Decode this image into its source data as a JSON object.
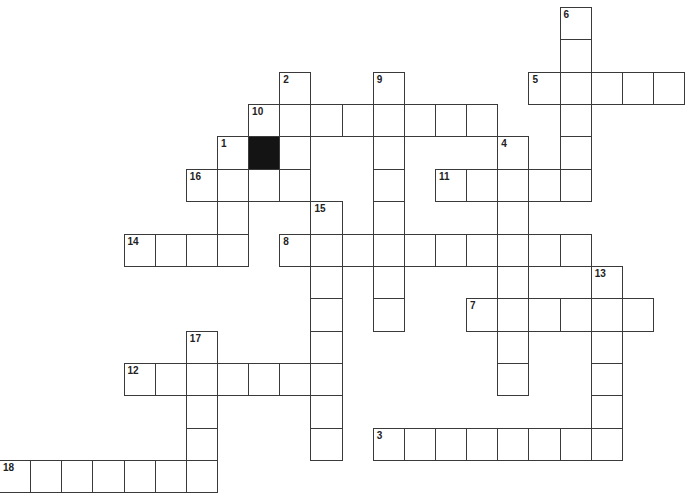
{
  "puzzle": {
    "grid": {
      "origin_x": -1,
      "origin_y": 7,
      "cell_width": 31.14,
      "cell_height": 32.36,
      "line_color": "#3a3a3a",
      "block_color": "#141414"
    },
    "entries": [
      {
        "number": "1",
        "direction": "down",
        "row": 4,
        "col": 7,
        "length": 4
      },
      {
        "number": "2",
        "direction": "down",
        "row": 2,
        "col": 9,
        "length": 4
      },
      {
        "number": "3",
        "direction": "across",
        "row": 13,
        "col": 12,
        "length": 8
      },
      {
        "number": "4",
        "direction": "down",
        "row": 4,
        "col": 16,
        "length": 8
      },
      {
        "number": "5",
        "direction": "across",
        "row": 2,
        "col": 17,
        "length": 5
      },
      {
        "number": "6",
        "direction": "down",
        "row": 0,
        "col": 18,
        "length": 6
      },
      {
        "number": "7",
        "direction": "across",
        "row": 9,
        "col": 15,
        "length": 6
      },
      {
        "number": "8",
        "direction": "across",
        "row": 7,
        "col": 9,
        "length": 10
      },
      {
        "number": "9",
        "direction": "down",
        "row": 2,
        "col": 12,
        "length": 8
      },
      {
        "number": "10",
        "direction": "across",
        "row": 3,
        "col": 8,
        "length": 8
      },
      {
        "number": "11",
        "direction": "across",
        "row": 5,
        "col": 14,
        "length": 5
      },
      {
        "number": "12",
        "direction": "across",
        "row": 11,
        "col": 4,
        "length": 7
      },
      {
        "number": "13",
        "direction": "down",
        "row": 8,
        "col": 19,
        "length": 6
      },
      {
        "number": "14",
        "direction": "across",
        "row": 7,
        "col": 4,
        "length": 4
      },
      {
        "number": "15",
        "direction": "down",
        "row": 6,
        "col": 10,
        "length": 8
      },
      {
        "number": "16",
        "direction": "across",
        "row": 5,
        "col": 6,
        "length": 4
      },
      {
        "number": "17",
        "direction": "down",
        "row": 10,
        "col": 6,
        "length": 5
      },
      {
        "number": "18",
        "direction": "across",
        "row": 14,
        "col": 0,
        "length": 7
      }
    ],
    "blocks": [
      {
        "row": 4,
        "col": 8
      }
    ]
  }
}
